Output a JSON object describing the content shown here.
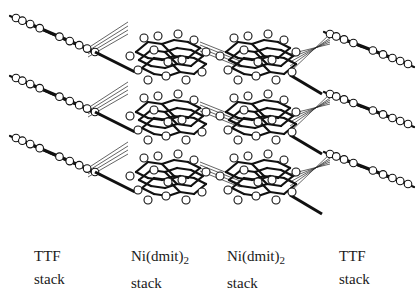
{
  "figure": {
    "labels": [
      {
        "name": "TTF",
        "subscript": "",
        "line2": "stack",
        "x": 34
      },
      {
        "name": "Ni(dmit)",
        "subscript": "2",
        "line2": "stack",
        "x": 131
      },
      {
        "name": "Ni(dmit)",
        "subscript": "2",
        "line2": "stack",
        "x": 227
      },
      {
        "name": "TTF",
        "subscript": "",
        "line2": "stack",
        "x": 339
      }
    ],
    "rows": 3,
    "colors": {
      "background": "#ffffff",
      "ink": "#111111"
    }
  }
}
